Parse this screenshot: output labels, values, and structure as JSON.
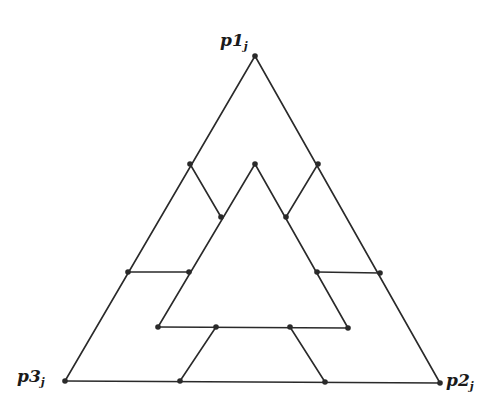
{
  "diagram": {
    "stroke_color": "#2a2a2a",
    "background": "#ffffff",
    "vertices": {
      "p1": {
        "x": 255,
        "y": 56
      },
      "p2": {
        "x": 440,
        "y": 383
      },
      "p3": {
        "x": 65,
        "y": 381
      }
    },
    "labels": [
      {
        "id": "p1",
        "base": "p1",
        "sub": "j",
        "x": 220,
        "y": 32
      },
      {
        "id": "p2",
        "base": "p2",
        "sub": "j",
        "x": 446,
        "y": 372
      },
      {
        "id": "p3",
        "base": "p3",
        "sub": "j",
        "x": 17,
        "y": 368
      }
    ],
    "points": [
      {
        "x": 255,
        "y": 56
      },
      {
        "x": 440,
        "y": 383
      },
      {
        "x": 65,
        "y": 381
      },
      {
        "x": 190,
        "y": 164
      },
      {
        "x": 255,
        "y": 164
      },
      {
        "x": 318,
        "y": 164
      },
      {
        "x": 221,
        "y": 217
      },
      {
        "x": 286,
        "y": 217
      },
      {
        "x": 128,
        "y": 272
      },
      {
        "x": 189,
        "y": 272
      },
      {
        "x": 317,
        "y": 272
      },
      {
        "x": 380,
        "y": 273
      },
      {
        "x": 158,
        "y": 327
      },
      {
        "x": 216,
        "y": 327
      },
      {
        "x": 290,
        "y": 327
      },
      {
        "x": 348,
        "y": 328
      },
      {
        "x": 180,
        "y": 381
      },
      {
        "x": 325,
        "y": 382
      }
    ],
    "segments": [
      {
        "x1": 255,
        "y1": 56,
        "x2": 440,
        "y2": 383
      },
      {
        "x1": 255,
        "y1": 56,
        "x2": 65,
        "y2": 381
      },
      {
        "x1": 65,
        "y1": 381,
        "x2": 440,
        "y2": 383
      },
      {
        "x1": 255,
        "y1": 164,
        "x2": 158,
        "y2": 327
      },
      {
        "x1": 255,
        "y1": 164,
        "x2": 348,
        "y2": 328
      },
      {
        "x1": 158,
        "y1": 327,
        "x2": 348,
        "y2": 328
      },
      {
        "x1": 190,
        "y1": 164,
        "x2": 221,
        "y2": 217
      },
      {
        "x1": 318,
        "y1": 164,
        "x2": 286,
        "y2": 217
      },
      {
        "x1": 128,
        "y1": 272,
        "x2": 189,
        "y2": 272
      },
      {
        "x1": 317,
        "y1": 272,
        "x2": 380,
        "y2": 273
      },
      {
        "x1": 216,
        "y1": 327,
        "x2": 180,
        "y2": 381
      },
      {
        "x1": 290,
        "y1": 327,
        "x2": 325,
        "y2": 382
      }
    ]
  }
}
